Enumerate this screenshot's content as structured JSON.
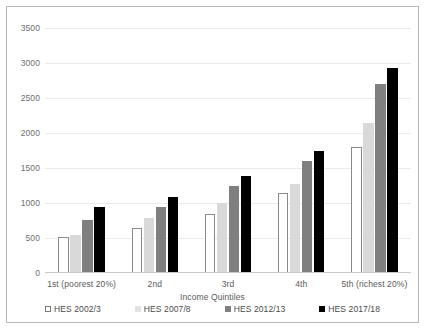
{
  "chart_data": {
    "type": "bar",
    "title": "",
    "xlabel": "Income Quintiles",
    "ylabel": "",
    "categories": [
      "1st (poorest 20%)",
      "2nd",
      "3rd",
      "4th",
      "5th (richest 20%)"
    ],
    "series": [
      {
        "name": "HES 2002/3",
        "color": "#ffffff",
        "values": [
          510,
          640,
          840,
          1145,
          1800
        ]
      },
      {
        "name": "HES 2007/8",
        "color": "#d9d9d9",
        "values": [
          540,
          790,
          1000,
          1270,
          2150
        ]
      },
      {
        "name": "HES 2012/13",
        "color": "#7f7f7f",
        "values": [
          760,
          940,
          1245,
          1595,
          2700
        ]
      },
      {
        "name": "HES 2017/18",
        "color": "#000000",
        "values": [
          945,
          1080,
          1390,
          1750,
          2930
        ]
      }
    ],
    "ylim": [
      0,
      3500
    ],
    "yticks": [
      0,
      500,
      1000,
      1500,
      2000,
      2500,
      3000,
      3500
    ],
    "ytick_labels": [
      "0",
      "500",
      "1000",
      "1500",
      "2000",
      "2500",
      "3000",
      "3500"
    ],
    "grid": true,
    "legend_position": "bottom"
  },
  "legend": {
    "items": [
      {
        "label": "HES 2002/3"
      },
      {
        "label": "HES 2007/8"
      },
      {
        "label": "HES 2012/13"
      },
      {
        "label": "HES 2017/18"
      }
    ]
  }
}
